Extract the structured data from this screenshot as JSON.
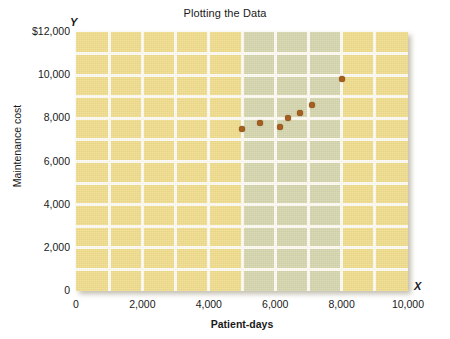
{
  "chart_data": {
    "type": "scatter",
    "title": "Plotting the Data",
    "xlabel": "Patient-days",
    "ylabel": "Maintenance cost",
    "axis_letter_x": "X",
    "axis_letter_y": "Y",
    "xlim": [
      0,
      10000
    ],
    "ylim": [
      0,
      12000
    ],
    "xticks": [
      0,
      2000,
      4000,
      6000,
      8000,
      10000
    ],
    "xtick_labels": [
      "0",
      "2,000",
      "4,000",
      "6,000",
      "8,000",
      "10,000"
    ],
    "yticks": [
      0,
      2000,
      4000,
      6000,
      8000,
      10000,
      12000
    ],
    "ytick_labels": [
      "0",
      "2,000",
      "4,000",
      "6,000",
      "8,000",
      "10,000",
      "$12,000"
    ],
    "grid": true,
    "grid_color": "#fdfbf2",
    "plot_background": "#f0dc8c",
    "highlight_band_color": "#d5d6ad",
    "highlight_band_x_range": [
      5000,
      8000
    ],
    "point_color": "#a8601f",
    "legend": null,
    "points": [
      {
        "x": 5000,
        "y": 7500
      },
      {
        "x": 5550,
        "y": 7800
      },
      {
        "x": 6150,
        "y": 7600
      },
      {
        "x": 6400,
        "y": 8000
      },
      {
        "x": 6750,
        "y": 8250
      },
      {
        "x": 7100,
        "y": 8600
      },
      {
        "x": 8000,
        "y": 9800
      }
    ],
    "x_minor_gridlines": [
      1000,
      2000,
      3000,
      4000,
      5000,
      6000,
      7000,
      8000,
      9000
    ],
    "y_minor_gridlines": [
      1000,
      2000,
      3000,
      4000,
      5000,
      6000,
      7000,
      8000,
      9000,
      10000,
      11000
    ]
  }
}
